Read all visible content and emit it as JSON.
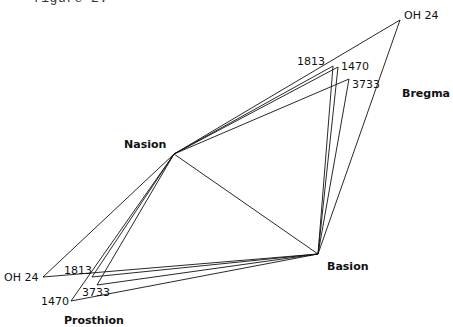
{
  "caption": "figure 2.",
  "landmarks": {
    "nasion": {
      "label": "Nasion",
      "x": 174,
      "y": 154
    },
    "basion": {
      "label": "Basion",
      "x": 318,
      "y": 254
    },
    "bregma": {
      "label": "Bregma"
    },
    "prosthion": {
      "label": "Prosthion"
    }
  },
  "specimens": [
    {
      "id": "OH 24",
      "bregma": [
        400,
        20
      ],
      "prosthion": [
        43,
        277
      ],
      "bregma_label": "OH 24",
      "prosthion_label": "OH 24"
    },
    {
      "id": "1813",
      "bregma": [
        333,
        66
      ],
      "prosthion": [
        92,
        277
      ],
      "bregma_label": "1813",
      "prosthion_label": "1813"
    },
    {
      "id": "1470",
      "bregma": [
        338,
        67
      ],
      "prosthion": [
        71,
        301
      ],
      "bregma_label": "1470",
      "prosthion_label": "1470"
    },
    {
      "id": "3733",
      "bregma": [
        349,
        79
      ],
      "prosthion": [
        97,
        285
      ],
      "bregma_label": "3733",
      "prosthion_label": "3733"
    }
  ]
}
